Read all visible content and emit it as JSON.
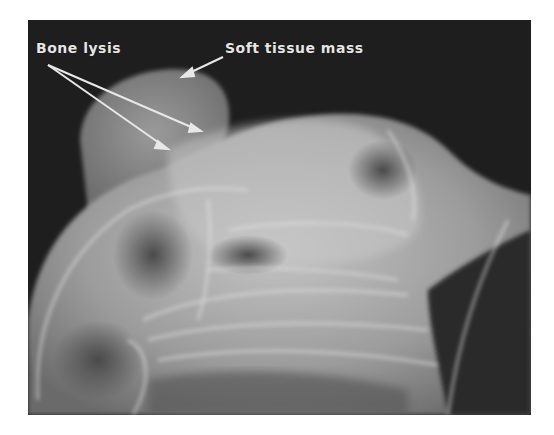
{
  "figure": {
    "type": "radiograph",
    "background_color": "#1e1e1e",
    "annotations": [
      {
        "label": "Bone lysis",
        "arrow_count": 2
      },
      {
        "label": "Soft tissue mass",
        "arrow_count": 1
      }
    ]
  }
}
